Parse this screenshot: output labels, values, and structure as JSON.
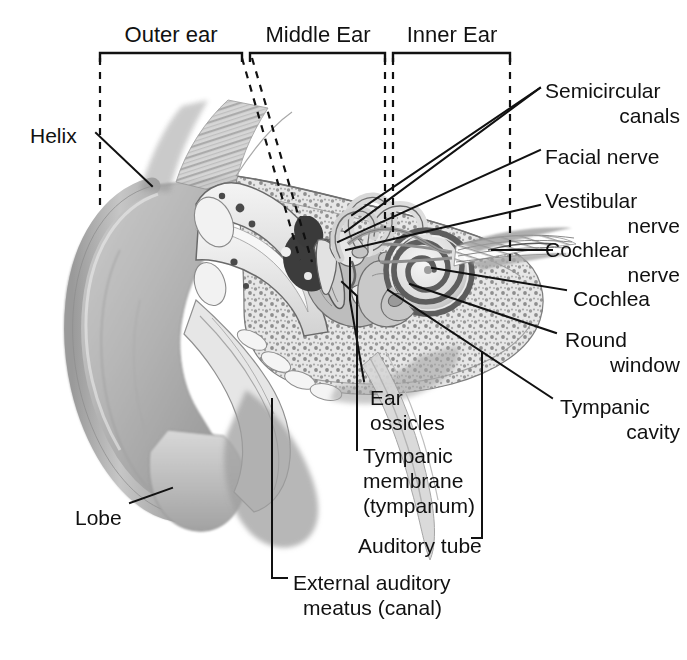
{
  "figure": {
    "style": "grayscale medical illustration",
    "background_color": "#ffffff",
    "ink_color": "#111111"
  },
  "region_headers": [
    {
      "id": "outer",
      "label": "Outer ear",
      "bracket_x1": 100,
      "bracket_x2": 242,
      "text_cx": 171,
      "text_y": 26
    },
    {
      "id": "middle",
      "label": "Middle Ear",
      "bracket_x1": 250,
      "bracket_x2": 385,
      "text_cx": 318,
      "text_y": 26
    },
    {
      "id": "inner",
      "label": "Inner Ear",
      "bracket_x1": 393,
      "bracket_x2": 510,
      "text_cx": 452,
      "text_y": 26
    }
  ],
  "labels": {
    "helix": {
      "text": "Helix",
      "x": 30,
      "y": 123,
      "align": "left"
    },
    "lobe": {
      "text": "Lobe",
      "x": 75,
      "y": 505,
      "align": "left"
    },
    "semicircular_canals": {
      "line1": "Semicircular",
      "line2": "canals",
      "x": 545,
      "y": 78,
      "align": "left"
    },
    "facial_nerve": {
      "text": "Facial nerve",
      "x": 545,
      "y": 144,
      "align": "left"
    },
    "vestibular_nerve": {
      "line1": "Vestibular",
      "line2": "nerve",
      "x": 545,
      "y": 188,
      "align": "left"
    },
    "cochlear_nerve": {
      "line1": "Cochlear",
      "line2": "nerve",
      "x": 560,
      "y": 237,
      "align": "left"
    },
    "cochlea": {
      "text": "Cochlea",
      "x": 573,
      "y": 286,
      "align": "left"
    },
    "round_window": {
      "line1": "Round",
      "line2": "window",
      "x": 565,
      "y": 327,
      "align": "left"
    },
    "tympanic_cavity": {
      "line1": "Tympanic",
      "line2": "cavity",
      "x": 560,
      "y": 394,
      "align": "left"
    },
    "ear_ossicles": {
      "line1": "Ear",
      "line2": "ossicles",
      "x": 370,
      "y": 385,
      "align": "left"
    },
    "tympanic_membrane": {
      "line1": "Tympanic",
      "line2": "membrane",
      "line3": "(tympanum)",
      "x": 363,
      "y": 443,
      "align": "left"
    },
    "auditory_tube": {
      "text": "Auditory tube",
      "x": 358,
      "y": 533,
      "align": "left"
    },
    "external_auditory_meatus": {
      "line1": "External auditory",
      "line2": "meatus (canal)",
      "x": 293,
      "y": 570,
      "align": "left"
    }
  },
  "leader_lines": [
    {
      "name": "helix",
      "path": "M 96,133 L 152,186"
    },
    {
      "name": "lobe",
      "path": "M 130,503 L 172,488"
    },
    {
      "name": "semicircular-canals-a",
      "path": "M 540,88  L 352,215"
    },
    {
      "name": "semicircular-canals-b",
      "path": "M 540,88  L 345,230"
    },
    {
      "name": "facial-nerve",
      "path": "M 540,150 L 340,240"
    },
    {
      "name": "vestibular-nerve",
      "path": "M 540,205 L 348,248"
    },
    {
      "name": "cochlear-nerve",
      "path": "M 552,250 L 492,250"
    },
    {
      "name": "cochlea",
      "path": "M 566,290 L 432,268"
    },
    {
      "name": "round-window",
      "path": "M 556,333 L 410,285"
    },
    {
      "name": "tympanic-cavity",
      "path": "M 552,398 L 390,289"
    },
    {
      "name": "ear-ossicles",
      "path": "M 364,383 L 350,300 L 350,258"
    },
    {
      "name": "tympanic-membrane",
      "path": "M 357,452 L 357,295 L 344,280"
    },
    {
      "name": "auditory-tube",
      "path": "M 470,538 L 482,538 L 482,352"
    },
    {
      "name": "meatus",
      "path": "M 287,578 L 272,578 L 272,399"
    }
  ],
  "anatomy_parts": [
    "pinna / auricle",
    "helix rim",
    "earlobe",
    "external auditory meatus",
    "tympanic membrane",
    "ear ossicles (malleus, incus, stapes)",
    "tympanic cavity",
    "auditory (eustachian) tube",
    "semicircular canals",
    "vestibule",
    "cochlea",
    "facial nerve",
    "vestibular nerve",
    "cochlear nerve",
    "round window",
    "temporal bone (cancellous)"
  ]
}
